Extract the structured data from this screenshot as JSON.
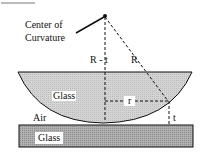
{
  "diagram": {
    "labels": {
      "center": "Center of",
      "curvature": "Curvature",
      "r_minus_t": "R - t",
      "radius": "R",
      "lens_glass": "Glass",
      "small_r": "r",
      "air": "Air",
      "thickness": "t",
      "plate_glass": "Glass"
    },
    "colors": {
      "lens_fill": "#d9d9d9",
      "plate_fill": "#a8a8a8",
      "line": "#111111"
    }
  }
}
